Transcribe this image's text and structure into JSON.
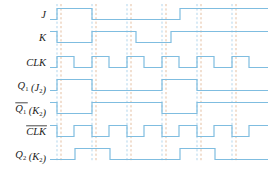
{
  "figure": {
    "type": "digital-timing-diagram",
    "title": "",
    "width": 273,
    "height": 169,
    "background": "#ffffff"
  },
  "style": {
    "waveform_color": "#7fbde0",
    "waveform_width": 1.2,
    "grid_blue": "#8fc3e4",
    "grid_orange": "#d9a47a",
    "label_color": "#1b1b1b",
    "label_size": 10.5,
    "subscript_size": 6.5
  },
  "geometry": {
    "x_start": 50,
    "x_end": 268,
    "clock_period": 35,
    "half_period": 17.5,
    "first_edge": 57,
    "row_height": 23,
    "wave_amplitude": 11
  },
  "gridlines": {
    "note": "paired dashed verticals at each clock edge; blue then orange",
    "blue_x": [
      57,
      92,
      127,
      162,
      197,
      232
    ],
    "orange_x": [
      61,
      96,
      131,
      166,
      201,
      236
    ],
    "top": 4,
    "bottom": 162
  },
  "rows": [
    {
      "id": "J",
      "label_parts": [
        {
          "text": "J",
          "sub": ""
        }
      ],
      "label_overline": false,
      "y_center": 14,
      "initial": 0,
      "transitions": [
        {
          "x": 57,
          "to": 1
        },
        {
          "x": 92,
          "to": 0
        },
        {
          "x": 180,
          "to": 1
        }
      ],
      "final": 1
    },
    {
      "id": "K",
      "label_parts": [
        {
          "text": "K",
          "sub": ""
        }
      ],
      "label_overline": false,
      "y_center": 37,
      "initial": 1,
      "transitions": [
        {
          "x": 57,
          "to": 0
        },
        {
          "x": 92,
          "to": 1
        },
        {
          "x": 136,
          "to": 0
        },
        {
          "x": 171,
          "to": 1
        }
      ],
      "final": 1
    },
    {
      "id": "CLK",
      "label_parts": [
        {
          "text": "CLK",
          "sub": ""
        }
      ],
      "label_overline": false,
      "y_center": 62,
      "initial": 0,
      "transitions": [
        {
          "x": 57,
          "to": 1
        },
        {
          "x": 74,
          "to": 0
        },
        {
          "x": 92,
          "to": 1
        },
        {
          "x": 109,
          "to": 0
        },
        {
          "x": 127,
          "to": 1
        },
        {
          "x": 144,
          "to": 0
        },
        {
          "x": 162,
          "to": 1
        },
        {
          "x": 179,
          "to": 0
        },
        {
          "x": 197,
          "to": 1
        },
        {
          "x": 214,
          "to": 0
        },
        {
          "x": 232,
          "to": 1
        },
        {
          "x": 249,
          "to": 0
        }
      ],
      "final": 0
    },
    {
      "id": "Q1",
      "label_parts": [
        {
          "text": "Q",
          "sub": "1"
        },
        {
          "text": " (J",
          "sub": "2"
        },
        {
          "text": ")",
          "sub": ""
        }
      ],
      "label_overline": false,
      "y_center": 85,
      "initial": 0,
      "transitions": [
        {
          "x": 57,
          "to": 1
        },
        {
          "x": 92,
          "to": 0
        },
        {
          "x": 162,
          "to": 1
        },
        {
          "x": 197,
          "to": 0
        }
      ],
      "final": 0
    },
    {
      "id": "Q1bar",
      "label_parts": [
        {
          "text": "Q",
          "sub": "1"
        },
        {
          "text": " (K",
          "sub": "2"
        },
        {
          "text": ")",
          "sub": ""
        }
      ],
      "label_overline": true,
      "overline_span": "Q1",
      "y_center": 108,
      "initial": 1,
      "transitions": [
        {
          "x": 57,
          "to": 0
        },
        {
          "x": 92,
          "to": 1
        },
        {
          "x": 162,
          "to": 0
        },
        {
          "x": 197,
          "to": 1
        }
      ],
      "final": 1
    },
    {
      "id": "CLKbar",
      "label_parts": [
        {
          "text": "CLK",
          "sub": ""
        }
      ],
      "label_overline": true,
      "overline_span": "CLK",
      "y_center": 131,
      "initial": 1,
      "transitions": [
        {
          "x": 57,
          "to": 0
        },
        {
          "x": 74,
          "to": 1
        },
        {
          "x": 92,
          "to": 0
        },
        {
          "x": 109,
          "to": 1
        },
        {
          "x": 127,
          "to": 0
        },
        {
          "x": 144,
          "to": 1
        },
        {
          "x": 162,
          "to": 0
        },
        {
          "x": 179,
          "to": 1
        },
        {
          "x": 197,
          "to": 0
        },
        {
          "x": 214,
          "to": 1
        },
        {
          "x": 232,
          "to": 0
        },
        {
          "x": 249,
          "to": 1
        }
      ],
      "final": 1
    },
    {
      "id": "Q2",
      "label_parts": [
        {
          "text": "Q",
          "sub": "2"
        },
        {
          "text": " (K",
          "sub": "2"
        },
        {
          "text": ")",
          "sub": ""
        }
      ],
      "label_overline": false,
      "y_center": 154,
      "initial": 0,
      "transitions": [
        {
          "x": 75,
          "to": 1
        },
        {
          "x": 110,
          "to": 0
        },
        {
          "x": 180,
          "to": 1
        },
        {
          "x": 215,
          "to": 0
        }
      ],
      "final": 0
    }
  ],
  "chart_data": {
    "type": "line",
    "xlabel": "time",
    "ylabel": "logic level",
    "ylim": [
      0,
      1
    ],
    "x": [
      50,
      57,
      74,
      75,
      92,
      109,
      110,
      127,
      136,
      144,
      162,
      171,
      179,
      180,
      197,
      214,
      215,
      232,
      249,
      268
    ],
    "series": [
      {
        "name": "J",
        "kind": "digital",
        "initial": 0,
        "edges": [
          [
            57,
            1
          ],
          [
            92,
            0
          ],
          [
            180,
            1
          ]
        ]
      },
      {
        "name": "K",
        "kind": "digital",
        "initial": 1,
        "edges": [
          [
            57,
            0
          ],
          [
            92,
            1
          ],
          [
            136,
            0
          ],
          [
            171,
            1
          ]
        ]
      },
      {
        "name": "CLK",
        "kind": "digital",
        "initial": 0,
        "edges": [
          [
            57,
            1
          ],
          [
            74,
            0
          ],
          [
            92,
            1
          ],
          [
            109,
            0
          ],
          [
            127,
            1
          ],
          [
            144,
            0
          ],
          [
            162,
            1
          ],
          [
            179,
            0
          ],
          [
            197,
            1
          ],
          [
            214,
            0
          ],
          [
            232,
            1
          ],
          [
            249,
            0
          ]
        ]
      },
      {
        "name": "Q1 (J2)",
        "kind": "digital",
        "initial": 0,
        "edges": [
          [
            57,
            1
          ],
          [
            92,
            0
          ],
          [
            162,
            1
          ],
          [
            197,
            0
          ]
        ]
      },
      {
        "name": "Q1bar (K2)",
        "kind": "digital",
        "initial": 1,
        "edges": [
          [
            57,
            0
          ],
          [
            92,
            1
          ],
          [
            162,
            0
          ],
          [
            197,
            1
          ]
        ]
      },
      {
        "name": "CLKbar",
        "kind": "digital",
        "initial": 1,
        "edges": [
          [
            57,
            0
          ],
          [
            74,
            1
          ],
          [
            92,
            0
          ],
          [
            109,
            1
          ],
          [
            127,
            0
          ],
          [
            144,
            1
          ],
          [
            162,
            0
          ],
          [
            179,
            1
          ],
          [
            197,
            0
          ],
          [
            214,
            1
          ],
          [
            232,
            0
          ],
          [
            249,
            1
          ]
        ]
      },
      {
        "name": "Q2 (K2)",
        "kind": "digital",
        "initial": 0,
        "edges": [
          [
            75,
            1
          ],
          [
            110,
            0
          ],
          [
            180,
            1
          ],
          [
            215,
            0
          ]
        ]
      }
    ],
    "legend_position": "left-labels",
    "grid": true
  }
}
